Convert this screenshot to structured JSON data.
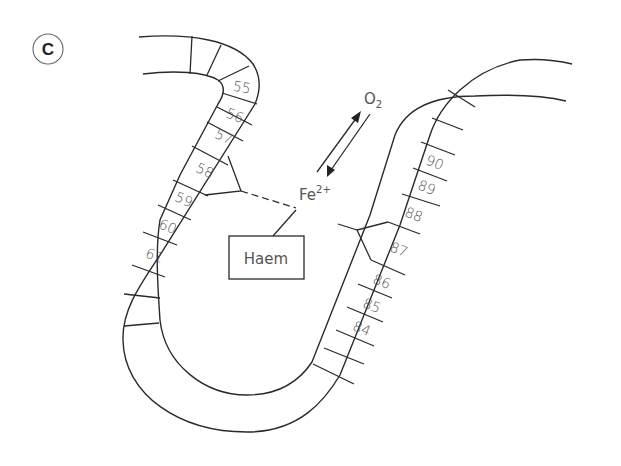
{
  "panel_label": "C",
  "diagram": {
    "residues_left": [
      "55",
      "56",
      "57",
      "58",
      "59",
      "60",
      "61"
    ],
    "residues_right": [
      "84",
      "85",
      "86",
      "87",
      "88",
      "89",
      "90"
    ],
    "haem_label": "Haem",
    "iron_label": "Fe",
    "iron_charge": "2+",
    "oxygen_label": "O",
    "oxygen_subscript": "2"
  }
}
